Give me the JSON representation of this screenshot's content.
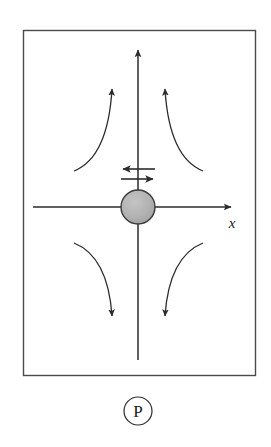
{
  "figure": {
    "panel_label": "P",
    "axis_label_x": "x",
    "frame": {
      "x": 23,
      "y": 30,
      "width": 232,
      "height": 345,
      "stroke": "#4a4a4a",
      "fill": "#ffffff"
    },
    "background_color": "#ffffff",
    "line_color": "#2b2b2b",
    "particle": {
      "name": "central-particle",
      "cx": 138,
      "cy": 207,
      "r": 17,
      "fill": "#b2b2b2",
      "stroke": "#3a3a3a"
    },
    "axes": {
      "horizontal": {
        "x1": 33,
        "y1": 207,
        "x2": 233,
        "y2": 207,
        "arrow_at": "right"
      },
      "vertical": {
        "x1": 138,
        "y1": 360,
        "x2": 138,
        "y2": 47,
        "arrow_at": "top"
      }
    },
    "double_arrows": [
      {
        "name": "left-pointing-arrow",
        "direction": "left",
        "x_start": 155,
        "x_end": 121,
        "y": 169
      },
      {
        "name": "right-pointing-arrow",
        "direction": "right",
        "x_start": 121,
        "x_end": 155,
        "y": 179
      }
    ],
    "streamlines": [
      {
        "name": "streamline-upper-left",
        "quadrant": "upper-left",
        "direction": "up",
        "tail": [
          74,
          171
        ],
        "head": [
          112,
          85
        ]
      },
      {
        "name": "streamline-upper-right",
        "quadrant": "upper-right",
        "direction": "up",
        "tail": [
          203,
          171
        ],
        "head": [
          165,
          85
        ]
      },
      {
        "name": "streamline-lower-left",
        "quadrant": "lower-left",
        "direction": "down",
        "tail": [
          74,
          243
        ],
        "head": [
          112,
          320
        ]
      },
      {
        "name": "streamline-lower-right",
        "quadrant": "lower-right",
        "direction": "down",
        "tail": [
          203,
          243
        ],
        "head": [
          165,
          320
        ]
      }
    ],
    "panel_badge": {
      "cx": 138,
      "cy": 411,
      "r": 14,
      "stroke": "#2b2b2b"
    }
  }
}
